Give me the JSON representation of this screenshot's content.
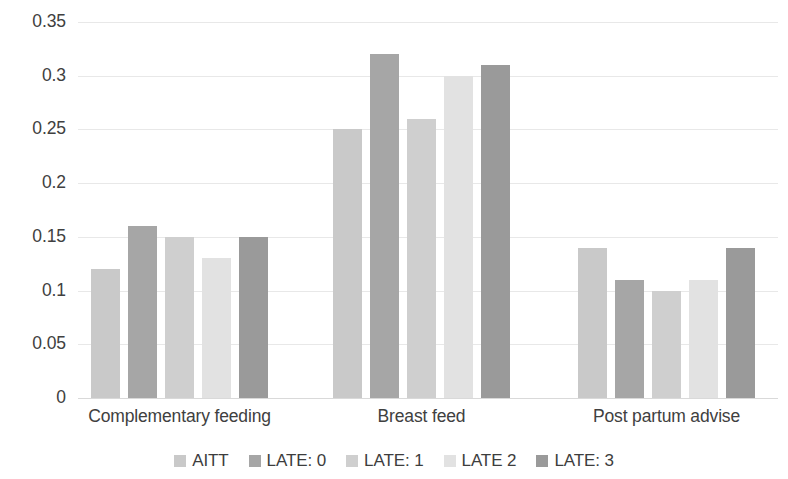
{
  "chart_data": {
    "type": "bar",
    "title": "",
    "subtitle": "",
    "xlabel": "",
    "ylabel": "",
    "categories": [
      "Complementary feeding",
      "Breast feed",
      "Post partum advise"
    ],
    "series": [
      {
        "name": "AITT",
        "color": "#c9c9c9",
        "values": [
          0.12,
          0.25,
          0.14
        ]
      },
      {
        "name": "LATE: 0",
        "color": "#a6a6a6",
        "values": [
          0.16,
          0.32,
          0.11
        ]
      },
      {
        "name": "LATE: 1",
        "color": "#cfcfcf",
        "values": [
          0.15,
          0.26,
          0.1
        ]
      },
      {
        "name": "LATE 2",
        "color": "#e2e2e2",
        "values": [
          0.13,
          0.3,
          0.11
        ]
      },
      {
        "name": "LATE: 3",
        "color": "#9a9a9a",
        "values": [
          0.15,
          0.31,
          0.14
        ]
      }
    ],
    "ylim": [
      0,
      0.35
    ],
    "yticks": [
      "0",
      "0.05",
      "0.1",
      "0.15",
      "0.2",
      "0.25",
      "0.3",
      "0.35"
    ],
    "ytick_values": [
      0,
      0.05,
      0.1,
      0.15,
      0.2,
      0.25,
      0.3,
      0.35
    ],
    "grid": true,
    "grid_axis": "y",
    "legend_position": "bottom",
    "background_color": "#ffffff",
    "gridline_color": "#e8e8e8"
  }
}
